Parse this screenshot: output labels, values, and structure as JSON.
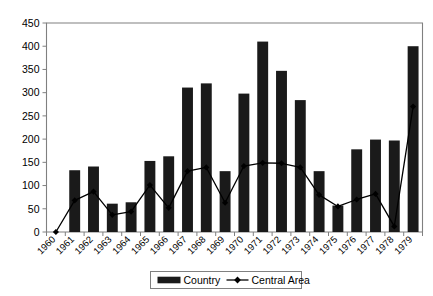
{
  "chart_data": {
    "type": "bar",
    "title": "",
    "subtitle": "",
    "xlabel": "",
    "ylabel": "",
    "categories": [
      "1960",
      "1961",
      "1962",
      "1963",
      "1964",
      "1965",
      "1966",
      "1967",
      "1968",
      "1969",
      "1970",
      "1971",
      "1972",
      "1973",
      "1974",
      "1975",
      "1976",
      "1977",
      "1978",
      "1979"
    ],
    "series": [
      {
        "name": "Country",
        "type": "bar",
        "color": "#1a1a1a",
        "values": [
          0,
          133,
          141,
          61,
          64,
          153,
          163,
          311,
          320,
          131,
          298,
          410,
          347,
          284,
          131,
          57,
          178,
          199,
          197,
          400
        ]
      },
      {
        "name": "Central Area",
        "type": "line",
        "color": "#000000",
        "marker": "diamond",
        "values": [
          0,
          68,
          87,
          37,
          44,
          101,
          52,
          131,
          139,
          63,
          142,
          149,
          148,
          139,
          80,
          55,
          70,
          82,
          12,
          270
        ]
      }
    ],
    "ylim": [
      0,
      450
    ],
    "ytick_values": [
      0,
      50,
      100,
      150,
      200,
      250,
      300,
      350,
      400,
      450
    ],
    "ytick_labels": [
      "0",
      "50",
      "100",
      "150",
      "200",
      "250",
      "300",
      "350",
      "400",
      "450"
    ],
    "grid": false,
    "legend_position": "bottom",
    "legend_entries": [
      {
        "label": "Country",
        "marker": "bar-swatch"
      },
      {
        "label": "Central Area",
        "marker": "line-diamond"
      }
    ],
    "axis_color": "#808080",
    "plot_background": "#ffffff"
  }
}
